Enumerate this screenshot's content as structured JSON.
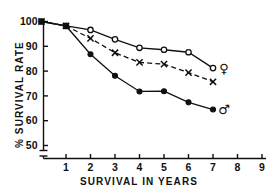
{
  "chart_data": {
    "type": "line",
    "title": "",
    "subtitle": "",
    "xlabel": "SURVIVAL  IN  YEARS",
    "ylabel": "% SURVIVAL  RATE",
    "xlim": [
      0,
      9
    ],
    "ylim": [
      45,
      101
    ],
    "y_axis_break_below": 50,
    "grid": false,
    "legend": "none",
    "legend_position": "inline-right-annotations",
    "xticks": [
      1,
      2,
      3,
      4,
      5,
      6,
      7,
      8,
      9
    ],
    "xtick_labels": [
      "1",
      "2",
      "3",
      "4",
      "5",
      "6",
      "7",
      "8",
      "9"
    ],
    "yticks": [
      50,
      60,
      70,
      80,
      90,
      100
    ],
    "ytick_labels": [
      "50",
      "60",
      "70",
      "80",
      "90",
      "100"
    ],
    "series": [
      {
        "name": "female",
        "marker": "open-circle",
        "line": "solid",
        "annotation": "♀",
        "x": [
          0,
          1,
          2,
          3,
          4,
          5,
          6,
          7
        ],
        "values": [
          100,
          98.2,
          96.6,
          92.8,
          89.4,
          88.6,
          87.6,
          81.2
        ]
      },
      {
        "name": "combined",
        "marker": "x",
        "line": "dashed",
        "annotation": "",
        "x": [
          0,
          1,
          2,
          3,
          4,
          5,
          6,
          7
        ],
        "values": [
          100,
          98.2,
          93.2,
          87.4,
          83.5,
          82.8,
          79.4,
          75.7
        ]
      },
      {
        "name": "male",
        "marker": "filled-circle",
        "line": "solid",
        "annotation": "♂",
        "x": [
          0,
          1,
          2,
          3,
          4,
          5,
          6,
          7
        ],
        "values": [
          100,
          98.2,
          86.8,
          78.1,
          71.8,
          71.9,
          67.4,
          64.5
        ]
      }
    ]
  },
  "axes": {
    "ylabel": "% SURVIVAL  RATE",
    "xlabel": "SURVIVAL  IN  YEARS"
  },
  "annotations": {
    "female_symbol": "♀",
    "male_symbol": "♂"
  },
  "colors": {
    "ink": "#101010",
    "background": "#ffffff"
  }
}
